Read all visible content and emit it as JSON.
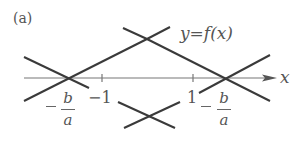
{
  "panel_label": "(a)",
  "curve_label": "y=f(x)",
  "axis": {
    "x_label": "x",
    "ticks": [
      {
        "label": "−1",
        "value": -1
      },
      {
        "label": "1",
        "value": 1
      }
    ]
  },
  "roots": [
    {
      "sign": "−",
      "numerator": "b",
      "denominator": "a"
    },
    {
      "sign": "−",
      "numerator": "b",
      "denominator": "a"
    }
  ],
  "colors": {
    "line": "#3a3a3a",
    "axis": "#666666",
    "text": "#555555"
  }
}
